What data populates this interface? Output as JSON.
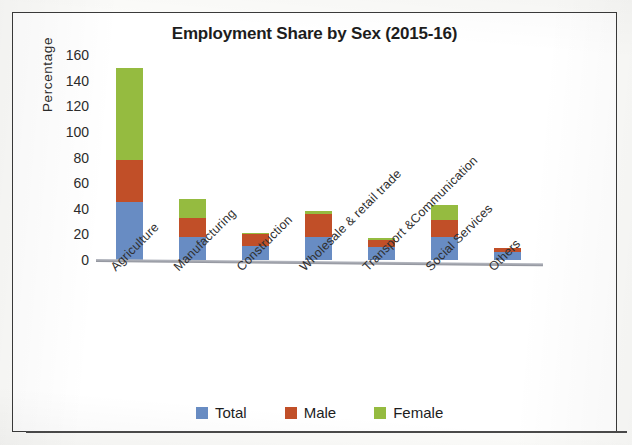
{
  "chart_data": {
    "type": "bar",
    "subtype": "stacked-column",
    "title": "Employment Share by Sex (2015-16)",
    "xlabel": "",
    "ylabel": "Percentage",
    "ylim": [
      0,
      160
    ],
    "ytick_step": 20,
    "yticks": [
      160,
      140,
      120,
      100,
      80,
      60,
      40,
      20,
      0
    ],
    "grid": false,
    "legend_position": "bottom",
    "categories": [
      "Agriculture",
      "Manufacturing",
      "Construction",
      "Wholesale & retail trade",
      "Transport &Communication",
      "Social Services",
      "Others"
    ],
    "series": [
      {
        "name": "Total",
        "color": "#688cc3",
        "values": [
          45,
          18,
          11,
          18,
          10,
          18,
          6
        ]
      },
      {
        "name": "Male",
        "color": "#c14f28",
        "values": [
          33,
          15,
          9,
          18,
          6,
          13,
          3
        ]
      },
      {
        "name": "Female",
        "color": "#95bb40",
        "values": [
          72,
          15,
          1,
          2,
          1,
          12,
          0
        ]
      }
    ],
    "stack_totals": [
      150,
      48,
      21,
      38,
      17,
      43,
      9
    ]
  },
  "chart": {
    "title": "Employment Share by Sex (2015-16)",
    "y_axis_label": "Percentage",
    "y_ticks": [
      "160",
      "140",
      "120",
      "100",
      "80",
      "60",
      "40",
      "20",
      "0"
    ],
    "x_ticks": [
      "Agriculture",
      "Manufacturing",
      "Construction",
      "Wholesale & retail trade",
      "Transport &Communication",
      "Social Services",
      "Others"
    ],
    "legend": [
      {
        "label": "Total",
        "color": "#688cc3"
      },
      {
        "label": "Male",
        "color": "#c14f28"
      },
      {
        "label": "Female",
        "color": "#95bb40"
      }
    ]
  }
}
